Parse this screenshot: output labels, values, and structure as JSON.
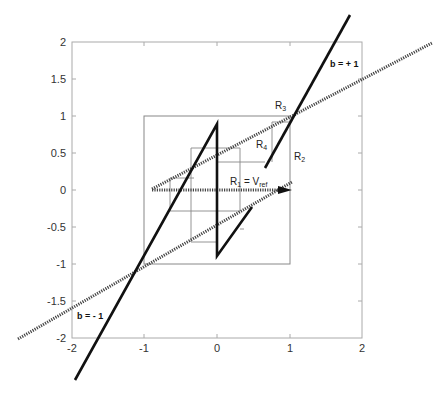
{
  "figure": {
    "axes": {
      "x_ticks": [
        "-2",
        "-1",
        "0",
        "1",
        "2"
      ],
      "y_ticks": [
        "2",
        "1.5",
        "1",
        "0.5",
        "0",
        "-0.5",
        "-1",
        "-1.5",
        "-2"
      ],
      "xlim": [
        -2,
        2
      ],
      "ylim": [
        -2,
        2
      ]
    },
    "labels": {
      "b_plus": "b = + 1",
      "b_minus": "b = - 1",
      "r1": "R",
      "r1_sub": "1",
      "r1_eq": " = V",
      "r1_ref": "ref",
      "r2": "R",
      "r2_sub": "2",
      "r3": "R",
      "r3_sub": "3",
      "r4": "R",
      "r4_sub": "4"
    },
    "colors": {
      "solid_line": "#111111",
      "dashed_line": "#555555",
      "grid_line": "#888888",
      "axis": "#999999"
    }
  }
}
